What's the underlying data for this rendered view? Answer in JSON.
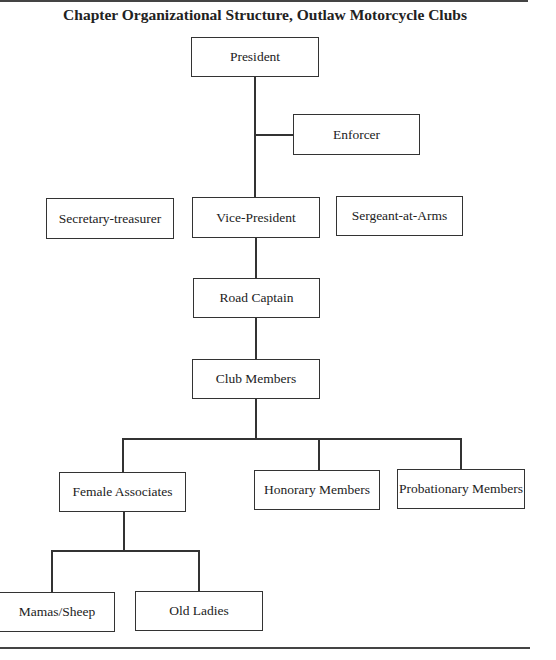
{
  "title": "Chapter Organizational Structure, Outlaw Motorcycle Clubs",
  "nodes": {
    "president": "President",
    "enforcer": "Enforcer",
    "secretary_treasurer": "Secretary-treasurer",
    "vice_president": "Vice-President",
    "sergeant_at_arms": "Sergeant-at-Arms",
    "road_captain": "Road Captain",
    "club_members": "Club Members",
    "female_associates": "Female Associates",
    "honorary_members": "Honorary Members",
    "probationary_members": "Probationary Members",
    "mamas_sheep": "Mamas/Sheep",
    "old_ladies": "Old Ladies"
  },
  "edges": [
    [
      "President",
      "Vice-President"
    ],
    [
      "President",
      "Enforcer"
    ],
    [
      "Vice-President",
      "Road Captain"
    ],
    [
      "Road Captain",
      "Club Members"
    ],
    [
      "Club Members",
      "Female Associates"
    ],
    [
      "Club Members",
      "Honorary Members"
    ],
    [
      "Club Members",
      "Probationary Members"
    ],
    [
      "Female Associates",
      "Mamas/Sheep"
    ],
    [
      "Female Associates",
      "Old Ladies"
    ]
  ]
}
